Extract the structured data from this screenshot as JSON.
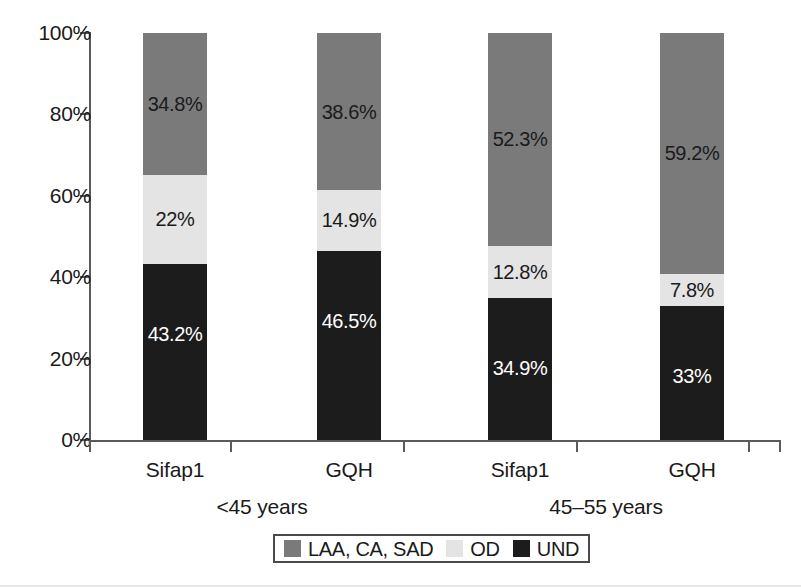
{
  "chart_data": {
    "type": "bar",
    "subtype": "stacked-100-percent",
    "title": "",
    "xlabel": "",
    "ylabel": "",
    "ylim": [
      0,
      100
    ],
    "y_ticks": [
      "0%",
      "20%",
      "40%",
      "60%",
      "80%",
      "100%"
    ],
    "grid": false,
    "legend_position": "bottom-center",
    "categories": [
      "Sifap1",
      "GQH",
      "Sifap1",
      "GQH"
    ],
    "groups": [
      {
        "label": "<45 years",
        "categories": [
          "Sifap1",
          "GQH"
        ]
      },
      {
        "label": "45–55 years",
        "categories": [
          "Sifap1",
          "GQH"
        ]
      }
    ],
    "series": [
      {
        "name": "LAA, CA, SAD",
        "color": "#7a7a7a",
        "values": [
          34.8,
          38.6,
          52.3,
          59.2
        ],
        "labels": [
          "34.8%",
          "38.6%",
          "52.3%",
          "59.2%"
        ]
      },
      {
        "name": "OD",
        "color": "#e4e4e4",
        "values": [
          22,
          14.9,
          12.8,
          7.8
        ],
        "labels": [
          "22%",
          "14.9%",
          "12.8%",
          "7.8%"
        ]
      },
      {
        "name": "UND",
        "color": "#1c1c1c",
        "values": [
          43.2,
          46.5,
          34.9,
          33
        ],
        "labels": [
          "43.2%",
          "46.5%",
          "34.9%",
          "33%"
        ]
      }
    ],
    "bars": [
      {
        "category": "Sifap1",
        "group": "<45 years",
        "segments": [
          {
            "series": "LAA, CA, SAD",
            "value": 34.8,
            "label": "34.8%",
            "label_color": "#1a1a1a"
          },
          {
            "series": "OD",
            "value": 22,
            "label": "22%",
            "label_color": "#1a1a1a"
          },
          {
            "series": "UND",
            "value": 43.2,
            "label": "43.2%",
            "label_color": "#ffffff"
          }
        ]
      },
      {
        "category": "GQH",
        "group": "<45 years",
        "segments": [
          {
            "series": "LAA, CA, SAD",
            "value": 38.6,
            "label": "38.6%",
            "label_color": "#1a1a1a"
          },
          {
            "series": "OD",
            "value": 14.9,
            "label": "14.9%",
            "label_color": "#1a1a1a"
          },
          {
            "series": "UND",
            "value": 46.5,
            "label": "46.5%",
            "label_color": "#ffffff"
          }
        ]
      },
      {
        "category": "Sifap1",
        "group": "45–55 years",
        "segments": [
          {
            "series": "LAA, CA, SAD",
            "value": 52.3,
            "label": "52.3%",
            "label_color": "#1a1a1a"
          },
          {
            "series": "OD",
            "value": 12.8,
            "label": "12.8%",
            "label_color": "#1a1a1a"
          },
          {
            "series": "UND",
            "value": 34.9,
            "label": "34.9%",
            "label_color": "#ffffff"
          }
        ]
      },
      {
        "category": "GQH",
        "group": "45–55 years",
        "segments": [
          {
            "series": "LAA, CA, SAD",
            "value": 59.2,
            "label": "59.2%",
            "label_color": "#1a1a1a"
          },
          {
            "series": "OD",
            "value": 7.8,
            "label": "7.8%",
            "label_color": "#1a1a1a"
          },
          {
            "series": "UND",
            "value": 33,
            "label": "33%",
            "label_color": "#ffffff"
          }
        ]
      }
    ],
    "legend": [
      {
        "label": "LAA, CA, SAD",
        "color": "#7a7a7a"
      },
      {
        "label": "OD",
        "color": "#e4e4e4"
      },
      {
        "label": "UND",
        "color": "#1c1c1c"
      }
    ]
  },
  "axis": {
    "y_tick_labels": [
      "100%",
      "80%",
      "60%",
      "40%",
      "20%",
      "0%"
    ]
  },
  "colors": {
    "laa": "#7a7a7a",
    "od": "#e4e4e4",
    "und": "#1c1c1c",
    "axis": "#5a5a5a",
    "text": "#1a1a1a",
    "background": "#ffffff"
  }
}
